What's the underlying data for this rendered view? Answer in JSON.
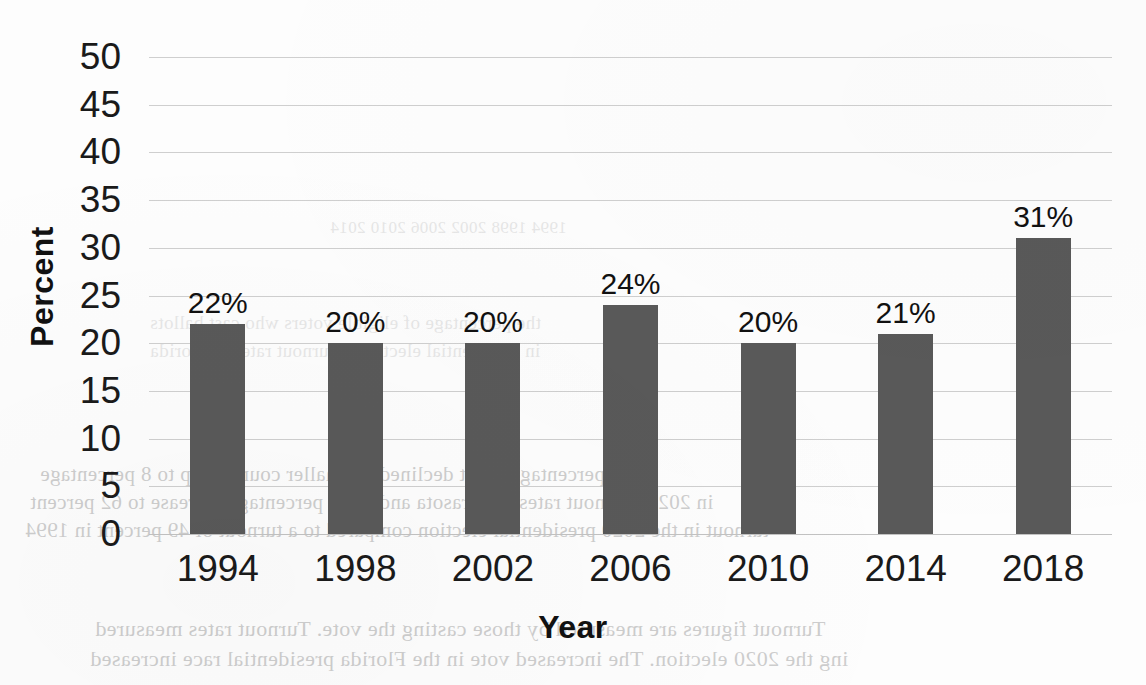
{
  "chart_data": {
    "type": "bar",
    "title": "",
    "subtitle": "",
    "xlabel": "Year",
    "ylabel": "Percent",
    "categories": [
      "1994",
      "1998",
      "2002",
      "2006",
      "2010",
      "2014",
      "2018"
    ],
    "values": [
      22,
      20,
      20,
      24,
      20,
      21,
      31
    ],
    "data_labels": [
      "22%",
      "20%",
      "20%",
      "24%",
      "20%",
      "21%",
      "31%"
    ],
    "ylim": [
      0,
      50
    ],
    "ytick_values": [
      50,
      45,
      40,
      35,
      30,
      25,
      20,
      15,
      10,
      5,
      0
    ],
    "ytick_labels": [
      "50",
      "45",
      "40",
      "35",
      "30",
      "25",
      "20",
      "15",
      "10",
      "5",
      "0"
    ],
    "grid": true,
    "grid_axis": "y",
    "legend": null,
    "legend_position": "none",
    "series": [
      {
        "name": "Percent",
        "values": [
          22,
          20,
          20,
          24,
          20,
          21,
          31
        ],
        "color": "#595959"
      }
    ],
    "annotations": []
  },
  "colors": {
    "bar_fill": "#595959",
    "gridline": "#cfcfcf",
    "text": "#1a1a1a",
    "background": "#fdfdfd"
  },
  "bleed_through": {
    "note": "faint mirrored text showing through from the reverse side of the scanned page",
    "fragments": [
      {
        "text": "1994        1998        2002        2006        2010        2014",
        "x": 330,
        "y": 218,
        "size": 17,
        "dark": false
      },
      {
        "text": "the percentage of eligible voters who cast ballots",
        "x": 150,
        "y": 312,
        "size": 19,
        "dark": false
      },
      {
        "text": "in presidential elections. Turnout rates in Florida",
        "x": 150,
        "y": 340,
        "size": 19,
        "dark": false
      },
      {
        "text": "percentage point declined in smaller counties up to 8 percentage",
        "x": 40,
        "y": 462,
        "size": 21,
        "dark": true
      },
      {
        "text": "in 2020. Turnout rates in Sarasota and Leon percentage increase to 62 percent",
        "x": 30,
        "y": 490,
        "size": 21,
        "dark": true
      },
      {
        "text": "turnout in the 2020 presidential election compared to a turnout of 49 percent in 1994",
        "x": 25,
        "y": 518,
        "size": 21,
        "dark": true
      },
      {
        "text": "Turnout figures are measured by those casting the vote. Turnout rates measured",
        "x": 95,
        "y": 616,
        "size": 22,
        "dark": true
      },
      {
        "text": "ing the 2020 election. The increased vote in the Florida presidential race increased",
        "x": 90,
        "y": 646,
        "size": 22,
        "dark": true
      }
    ]
  }
}
